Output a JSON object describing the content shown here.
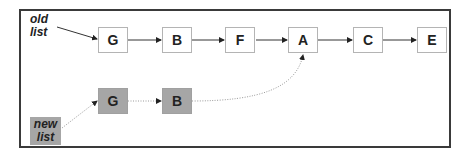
{
  "diagram": {
    "title": "",
    "labels": {
      "old_list": [
        "old",
        "list"
      ],
      "new_list": [
        "new",
        "list"
      ]
    },
    "old_list_nodes": [
      {
        "id": "G",
        "label": "G"
      },
      {
        "id": "B",
        "label": "B"
      },
      {
        "id": "F",
        "label": "F"
      },
      {
        "id": "A",
        "label": "A"
      },
      {
        "id": "C",
        "label": "C"
      },
      {
        "id": "E",
        "label": "E"
      }
    ],
    "new_list_nodes": [
      {
        "id": "G2",
        "label": "G"
      },
      {
        "id": "B2",
        "label": "B"
      }
    ],
    "edges": [
      {
        "from": "old list",
        "to": "G",
        "style": "solid"
      },
      {
        "from": "G",
        "to": "B",
        "style": "solid"
      },
      {
        "from": "B",
        "to": "F",
        "style": "solid"
      },
      {
        "from": "F",
        "to": "A",
        "style": "solid"
      },
      {
        "from": "A",
        "to": "C",
        "style": "solid"
      },
      {
        "from": "C",
        "to": "E",
        "style": "solid"
      },
      {
        "from": "new list",
        "to": "G2",
        "style": "dotted"
      },
      {
        "from": "G2",
        "to": "B2",
        "style": "dotted"
      },
      {
        "from": "B2",
        "to": "A",
        "style": "dotted-curve"
      }
    ],
    "colors": {
      "frame": "#3a3a3a",
      "node_border": "#b4b4b4",
      "new_node_fill": "#a6a6a6",
      "solid_edge": "#333333",
      "dotted_edge": "#9a9a9a"
    }
  }
}
